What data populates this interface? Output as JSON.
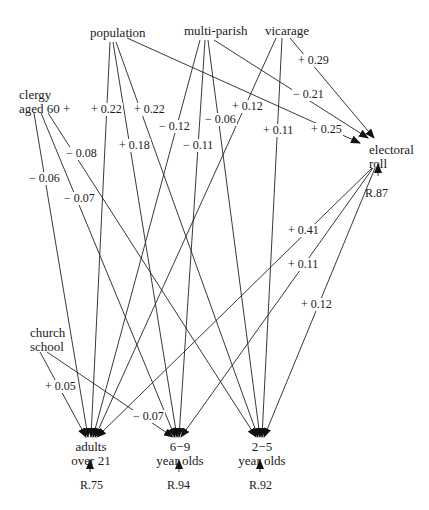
{
  "nodes": {
    "population": "population",
    "multi_parish": "multi-parish",
    "vicarage": "vicarage",
    "clergy_line1": "clergy",
    "clergy_line2": "aged 60 +",
    "electoral_line1": "electoral",
    "electoral_line2": "roll",
    "church_line1": "church",
    "church_line2": "school",
    "adults_line1": "adults",
    "adults_line2": "over 21",
    "six_nine_line1": "6−9",
    "six_nine_line2": "year olds",
    "two_five_line1": "2−5",
    "two_five_line2": "year olds"
  },
  "residuals": {
    "electoral_roll": "R.87",
    "adults_over_21": "R.75",
    "six_nine": "R.94",
    "two_five": "R.92"
  },
  "paths": [
    {
      "from": "population",
      "to": "adults over 21",
      "coef": "+ 0.22"
    },
    {
      "from": "population",
      "to": "6-9 year olds",
      "coef": "+ 0.18"
    },
    {
      "from": "population",
      "to": "2-5 year olds",
      "coef": "+ 0.22"
    },
    {
      "from": "population",
      "to": "electoral roll",
      "coef": "+ 0.25"
    },
    {
      "from": "multi-parish",
      "to": "adults over 21",
      "coef": "− 0.12"
    },
    {
      "from": "multi-parish",
      "to": "6-9 year olds",
      "coef": "− 0.11"
    },
    {
      "from": "multi-parish",
      "to": "2-5 year olds",
      "coef": "− 0.06"
    },
    {
      "from": "multi-parish",
      "to": "electoral roll",
      "coef": "− 0.21"
    },
    {
      "from": "vicarage",
      "to": "adults over 21",
      "coef": "+ 0.12"
    },
    {
      "from": "vicarage",
      "to": "2-5 year olds",
      "coef": "+ 0.11"
    },
    {
      "from": "vicarage",
      "to": "electoral roll",
      "coef": "+ 0.29"
    },
    {
      "from": "clergy aged 60+",
      "to": "adults over 21",
      "coef": "− 0.06"
    },
    {
      "from": "clergy aged 60+",
      "to": "6-9 year olds",
      "coef": "− 0.07"
    },
    {
      "from": "clergy aged 60+",
      "to": "2-5 year olds",
      "coef": "− 0.08"
    },
    {
      "from": "electoral roll",
      "to": "adults over 21",
      "coef": "+ 0.41"
    },
    {
      "from": "electoral roll",
      "to": "6-9 year olds",
      "coef": "+ 0.11"
    },
    {
      "from": "electoral roll",
      "to": "2-5 year olds",
      "coef": "+ 0.12"
    },
    {
      "from": "church school",
      "to": "adults over 21",
      "coef": "+ 0.05"
    },
    {
      "from": "church school",
      "to": "6-9 year olds",
      "coef": "− 0.07"
    }
  ]
}
